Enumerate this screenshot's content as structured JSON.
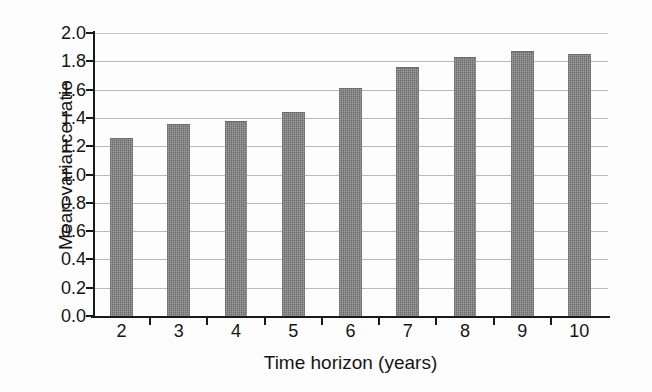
{
  "chart_data": {
    "type": "bar",
    "title": "",
    "xlabel": "Time horizon (years)",
    "ylabel": "Mean-variance ratio",
    "categories": [
      "2",
      "3",
      "4",
      "5",
      "6",
      "7",
      "8",
      "9",
      "10"
    ],
    "values": [
      1.26,
      1.36,
      1.38,
      1.44,
      1.61,
      1.76,
      1.83,
      1.87,
      1.85
    ],
    "ylim": [
      0.0,
      2.0
    ],
    "ytick_step": 0.2,
    "ytick_labels": [
      "0.0",
      "0.2",
      "0.4",
      "0.6",
      "0.8",
      "1.0",
      "1.2",
      "1.4",
      "1.6",
      "1.8",
      "2.0"
    ],
    "grid": true,
    "grid_axis": "y",
    "legend": false,
    "legend_position": "none",
    "series": [
      {
        "name": "Mean-variance ratio",
        "values": [
          1.26,
          1.36,
          1.38,
          1.44,
          1.61,
          1.76,
          1.83,
          1.87,
          1.85
        ]
      }
    ]
  },
  "colors": {
    "bar_fill": "#7b7b7b",
    "axis_line": "#1a1a1a",
    "gridline": "#b9b9b9",
    "text": "#151515",
    "background": "#fdfdfd"
  }
}
